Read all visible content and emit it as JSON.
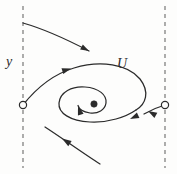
{
  "figure": {
    "type": "phase-portrait",
    "caption_labels": {
      "y_axis_label": "y",
      "unstable_manifold_label": "U"
    },
    "colors": {
      "stroke": "#2b2b2b",
      "background": "#fdfdfc",
      "dashed_line": "#8a8a8a"
    },
    "dashed_lines": [
      {
        "name": "left-boundary",
        "x": 23,
        "y_from": 6,
        "y_to": 168
      },
      {
        "name": "right-boundary",
        "x": 165,
        "y_from": 6,
        "y_to": 168
      }
    ],
    "fixed_points": [
      {
        "name": "saddle-left",
        "kind": "open-circle",
        "x": 23,
        "y": 105,
        "radius": 3.6
      },
      {
        "name": "saddle-right",
        "kind": "open-circle",
        "x": 165,
        "y": 105,
        "radius": 3.6
      },
      {
        "name": "spiral-center",
        "kind": "filled-dot",
        "x": 94,
        "y": 104,
        "radius": 3.2
      }
    ],
    "trajectories": [
      {
        "name": "upper-incoming-orbit",
        "path": "M 23,23 C 44,29 68,40 89,51",
        "arrow": {
          "x": 87,
          "y": 50,
          "angle_deg": 28
        }
      },
      {
        "name": "homoclinic-loop-upper",
        "path": "M 23,105 C 38,86 54,74 74,68 C 100,60 128,64 140,79 C 150,92 146,104 136,110",
        "arrow": {
          "x": 70,
          "y": 69,
          "angle_deg": -16
        }
      },
      {
        "name": "inner-spiral",
        "path": "M 136,110 C 126,117 108,123 90,122 C 70,121 58,113 59,103 C 60,92 72,86 85,87 C 99,88 107,95 106,103 C 105,110 98,114 90,113 C 84,112 79,109 78,105",
        "arrows": [
          {
            "x": 133,
            "y": 117,
            "angle_deg": 155
          },
          {
            "x": 78,
            "y": 106,
            "angle_deg": 250
          }
        ]
      },
      {
        "name": "right-outgoing-orbit",
        "path": "M 165,105 C 158,107 151,110 144,114",
        "arrow": {
          "x": 150,
          "y": 109,
          "angle_deg": 205
        }
      },
      {
        "name": "lower-incoming-orbit",
        "path": "M 100,164 C 84,154 62,138 45,127",
        "arrow": {
          "x": 63,
          "y": 139,
          "angle_deg": 213
        }
      }
    ]
  }
}
